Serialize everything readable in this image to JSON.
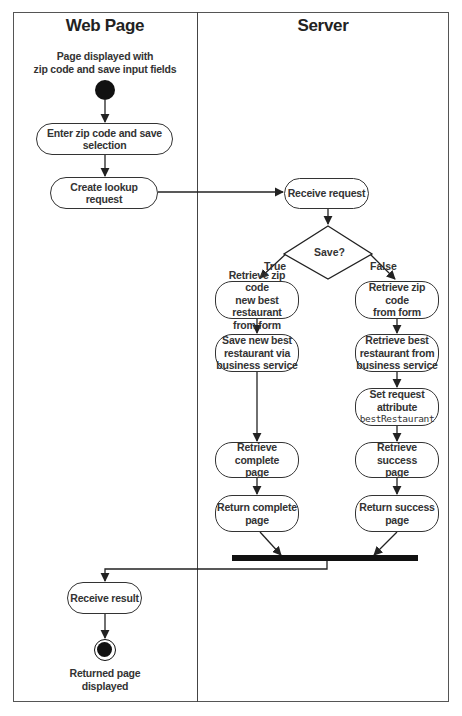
{
  "diagram": {
    "type": "activity-diagram",
    "lanes": [
      {
        "id": "web",
        "title": "Web Page"
      },
      {
        "id": "server",
        "title": "Server"
      }
    ],
    "start": {
      "label_line1": "Page displayed with",
      "label_line2": "zip code and save input fields"
    },
    "end": {
      "label_line1": "Returned page",
      "label_line2": "displayed"
    },
    "nodes": {
      "enter_zip": {
        "lane": "web",
        "text": "Enter zip code and save selection"
      },
      "create_lookup": {
        "lane": "web",
        "text": "Create lookup request"
      },
      "receive_request": {
        "lane": "server",
        "text": "Receive request"
      },
      "decision": {
        "lane": "server",
        "text": "Save?",
        "true_label": "True",
        "false_label": "False"
      },
      "t_retrieve_zip": {
        "lane": "server",
        "line1": "Retrieve zip code",
        "line2": "new best restaurant",
        "line3": "from form"
      },
      "t_save": {
        "lane": "server",
        "line1": "Save new best",
        "line2": "restaurant via",
        "line3": "business service"
      },
      "t_retrieve_complete": {
        "lane": "server",
        "line1": "Retrieve complete",
        "line2": "page"
      },
      "t_return_complete": {
        "lane": "server",
        "line1": "Return complete",
        "line2": "page"
      },
      "f_retrieve_zip": {
        "lane": "server",
        "line1": "Retrieve zip code",
        "line2": "from form"
      },
      "f_retrieve_best": {
        "lane": "server",
        "line1": "Retrieve best",
        "line2": "restaurant from",
        "line3": "business service"
      },
      "f_set_attr": {
        "lane": "server",
        "line1": "Set request",
        "line2": "attribute",
        "code": "bestRestaurant"
      },
      "f_retrieve_success": {
        "lane": "server",
        "line1": "Retrieve success",
        "line2": "page"
      },
      "f_return_success": {
        "lane": "server",
        "line1": "Return success",
        "line2": "page"
      },
      "receive_result": {
        "lane": "web",
        "text": "Receive result"
      }
    },
    "edges": [
      [
        "start",
        "enter_zip"
      ],
      [
        "enter_zip",
        "create_lookup"
      ],
      [
        "create_lookup",
        "receive_request"
      ],
      [
        "receive_request",
        "decision"
      ],
      [
        "decision",
        "t_retrieve_zip",
        "True"
      ],
      [
        "decision",
        "f_retrieve_zip",
        "False"
      ],
      [
        "t_retrieve_zip",
        "t_save"
      ],
      [
        "t_save",
        "t_retrieve_complete"
      ],
      [
        "t_retrieve_complete",
        "t_return_complete"
      ],
      [
        "f_retrieve_zip",
        "f_retrieve_best"
      ],
      [
        "f_retrieve_best",
        "f_set_attr"
      ],
      [
        "f_set_attr",
        "f_retrieve_success"
      ],
      [
        "f_retrieve_success",
        "f_return_success"
      ],
      [
        "t_return_complete",
        "join_bar"
      ],
      [
        "f_return_success",
        "join_bar"
      ],
      [
        "join_bar",
        "receive_result"
      ],
      [
        "receive_result",
        "end"
      ]
    ]
  }
}
